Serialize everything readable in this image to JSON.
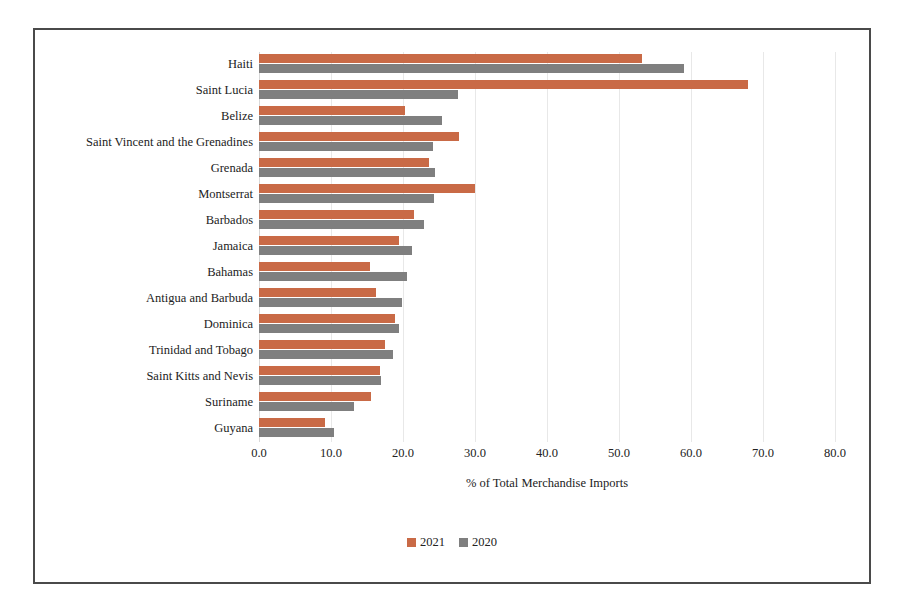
{
  "chart_data": {
    "type": "bar",
    "orientation": "horizontal",
    "title": "",
    "xlabel": "% of Total Merchandise Imports",
    "ylabel": "",
    "xlim": [
      0,
      80
    ],
    "xticks": [
      "0.0",
      "10.0",
      "20.0",
      "30.0",
      "40.0",
      "50.0",
      "60.0",
      "70.0",
      "80.0"
    ],
    "grid": "vertical",
    "legend_position": "bottom-center",
    "categories": [
      "Haiti",
      "Saint Lucia",
      "Belize",
      "Saint Vincent and the Grenadines",
      "Grenada",
      "Montserrat",
      "Barbados",
      "Jamaica",
      "Bahamas",
      "Antigua and Barbuda",
      "Dominica",
      "Trinidad and Tobago",
      "Saint Kitts and Nevis",
      "Suriname",
      "Guyana"
    ],
    "series": [
      {
        "name": "2021",
        "color": "#C96A46",
        "values": [
          53.2,
          67.9,
          20.3,
          27.8,
          23.6,
          30.0,
          21.5,
          19.4,
          15.4,
          16.2,
          18.9,
          17.5,
          16.8,
          15.6,
          9.2
        ]
      },
      {
        "name": "2020",
        "color": "#7F7F7F",
        "values": [
          59.0,
          27.6,
          25.4,
          24.2,
          24.4,
          24.3,
          22.9,
          21.3,
          20.6,
          19.9,
          19.4,
          18.6,
          17.0,
          13.2,
          10.4
        ]
      }
    ]
  },
  "colors": {
    "series_2021": "#C96A46",
    "series_2020": "#7F7F7F",
    "frame": "#4a4a4a",
    "gridline": "#e8e8e8",
    "background": "#ffffff"
  }
}
